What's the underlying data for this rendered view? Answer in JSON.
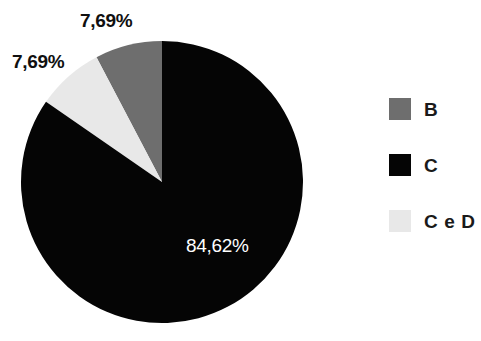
{
  "chart_data": {
    "type": "pie",
    "title": "",
    "labels": [
      "B",
      "C",
      "C e D"
    ],
    "values": [
      7.69,
      84.62,
      7.69
    ],
    "value_labels": [
      "7,69%",
      "84,62%",
      "7,69%"
    ],
    "colors": [
      "#6e6e6e",
      "#050505",
      "#e8e8e8"
    ],
    "legend_position": "right",
    "start_angle_deg": 90,
    "direction": "counterclockwise",
    "grid": false,
    "slices": [
      {
        "name": "B",
        "value": 7.69,
        "label": "7,69%",
        "color": "#6e6e6e"
      },
      {
        "name": "C e D",
        "value": 7.69,
        "label": "7,69%",
        "color": "#e8e8e8"
      },
      {
        "name": "C",
        "value": 84.62,
        "label": "84,62%",
        "color": "#050505"
      }
    ]
  },
  "labels": {
    "slice_b": "7,69%",
    "slice_ced": "7,69%",
    "slice_c": "84,62%"
  },
  "legend": {
    "items": [
      {
        "label": "B",
        "color": "#6e6e6e"
      },
      {
        "label": "C",
        "color": "#050505"
      },
      {
        "label": "C e D",
        "color": "#e8e8e8"
      }
    ]
  },
  "colors": {
    "background": "#ffffff",
    "gray": "#6e6e6e",
    "black": "#050505",
    "light_gray": "#e8e8e8",
    "text": "#1a1a1a",
    "text_inverse": "#ffffff"
  }
}
